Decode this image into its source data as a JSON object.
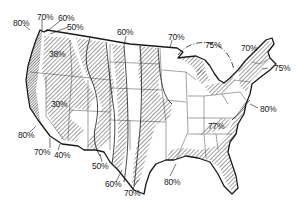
{
  "map": {
    "type": "isoline-map",
    "region": "Contiguous United States",
    "style": "hand-drawn line art with hatched bands",
    "colors": {
      "ink": "#1a1a1a",
      "hatch": "#2a2a2a",
      "background": "#ffffff"
    },
    "labels": [
      {
        "id": "nw-80",
        "text": "80%",
        "x": 13,
        "y": 19
      },
      {
        "id": "nw-70",
        "text": "70%",
        "x": 37,
        "y": 13
      },
      {
        "id": "nw-60",
        "text": "60%",
        "x": 58,
        "y": 14
      },
      {
        "id": "nw-50",
        "text": "50%",
        "x": 67,
        "y": 23
      },
      {
        "id": "idaho-38",
        "text": "38%",
        "x": 49,
        "y": 50
      },
      {
        "id": "montana-60",
        "text": "60%",
        "x": 117,
        "y": 28
      },
      {
        "id": "dakota-70",
        "text": "70%",
        "x": 168,
        "y": 33
      },
      {
        "id": "lakes-75",
        "text": "75%",
        "x": 205,
        "y": 41
      },
      {
        "id": "ne-70",
        "text": "70%",
        "x": 241,
        "y": 44
      },
      {
        "id": "ne-75",
        "text": "75%",
        "x": 274,
        "y": 64
      },
      {
        "id": "nevada-30",
        "text": "30%",
        "x": 51,
        "y": 100
      },
      {
        "id": "atl-80",
        "text": "80%",
        "x": 260,
        "y": 105
      },
      {
        "id": "app-77",
        "text": "77%",
        "x": 208,
        "y": 122
      },
      {
        "id": "ca-80",
        "text": "80%",
        "x": 18,
        "y": 131
      },
      {
        "id": "socal-70",
        "text": "70%",
        "x": 34,
        "y": 148
      },
      {
        "id": "az-40",
        "text": "40%",
        "x": 54,
        "y": 151
      },
      {
        "id": "nm-50",
        "text": "50%",
        "x": 92,
        "y": 162
      },
      {
        "id": "tx-60",
        "text": "60%",
        "x": 105,
        "y": 180
      },
      {
        "id": "tx-70",
        "text": "70%",
        "x": 124,
        "y": 189
      },
      {
        "id": "gulf-80",
        "text": "80%",
        "x": 164,
        "y": 178
      }
    ]
  }
}
